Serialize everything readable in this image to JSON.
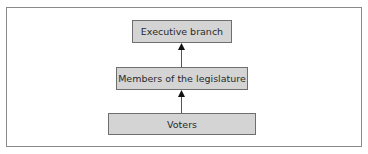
{
  "diagram": {
    "type": "flowchart",
    "direction": "bottom-to-top",
    "nodes": [
      {
        "id": "executive",
        "label": "Executive branch"
      },
      {
        "id": "legislature",
        "label": "Members of the legislature"
      },
      {
        "id": "voters",
        "label": "Voters"
      }
    ],
    "edges": [
      {
        "from": "voters",
        "to": "legislature"
      },
      {
        "from": "legislature",
        "to": "executive"
      }
    ],
    "colors": {
      "box_fill": "#d4d4d4",
      "box_border": "#6e6e6e",
      "arrow": "#555555",
      "frame_border": "#8a8a8a"
    }
  }
}
